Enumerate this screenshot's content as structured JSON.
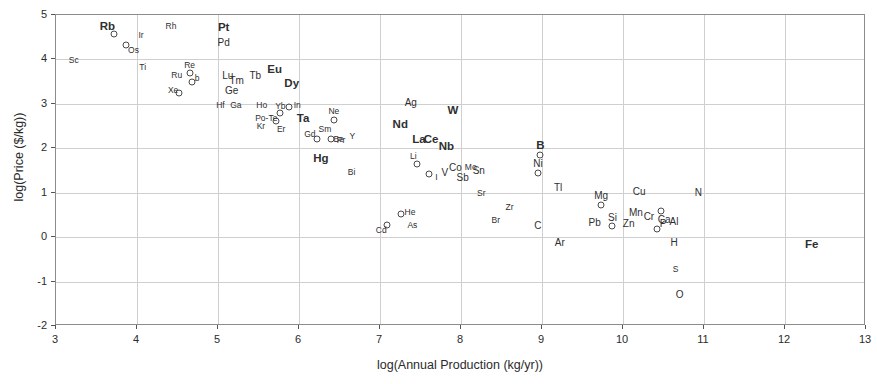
{
  "chart_data": {
    "type": "scatter",
    "title": "",
    "xlabel": "log(Annual Production (kg/yr))",
    "ylabel": "log(Price ($/kg))",
    "xlim": [
      3,
      13
    ],
    "ylim": [
      -2,
      5
    ],
    "xticks": [
      "3",
      "4",
      "5",
      "6",
      "7",
      "8",
      "9",
      "10",
      "11",
      "12",
      "13"
    ],
    "yticks": [
      "5",
      "4",
      "3",
      "2",
      "1",
      "0",
      "-1",
      "-2"
    ],
    "grid": true,
    "legend": "none",
    "marker": "open-circle",
    "point_label_note": "Each point is labelled with its chemical element symbol; some labels are drawn without a visible marker.",
    "points": [
      {
        "label": "Sc",
        "x": 3.22,
        "y": 3.98,
        "size": "sm",
        "marker": false
      },
      {
        "label": "Rb",
        "x": 3.72,
        "y": 4.58,
        "size": "lg",
        "marker": true,
        "dx": -7,
        "dy": -7
      },
      {
        "label": "Os",
        "x": 3.87,
        "y": 4.33,
        "size": "sm",
        "marker": true,
        "dx": 7,
        "dy": 5
      },
      {
        "label": "Ir",
        "x": 4.05,
        "y": 4.56,
        "size": "sm",
        "marker": false
      },
      {
        "label": "Rh",
        "x": 4.42,
        "y": 4.75,
        "size": "sm",
        "marker": false
      },
      {
        "label": "Ti",
        "x": 4.07,
        "y": 3.83,
        "size": "sm",
        "marker": false
      },
      {
        "label": "Ru",
        "x": 4.49,
        "y": 3.66,
        "size": "sm",
        "marker": false
      },
      {
        "label": "Re",
        "x": 4.65,
        "y": 3.7,
        "size": "sm",
        "marker": true,
        "dx": 0,
        "dy": -8
      },
      {
        "label": "b",
        "x": 4.68,
        "y": 3.5,
        "size": "sm",
        "marker": true,
        "dx": 5,
        "dy": -4
      },
      {
        "label": "Xe",
        "x": 4.52,
        "y": 3.25,
        "size": "sm",
        "marker": true,
        "dx": -6,
        "dy": -3
      },
      {
        "label": "Pt",
        "x": 5.07,
        "y": 4.71,
        "size": "lg",
        "marker": false
      },
      {
        "label": "Pd",
        "x": 5.07,
        "y": 4.37,
        "size": "md",
        "marker": false
      },
      {
        "label": "Lu",
        "x": 5.12,
        "y": 3.63,
        "size": "md",
        "marker": false
      },
      {
        "label": "Tm",
        "x": 5.23,
        "y": 3.52,
        "size": "md",
        "marker": false
      },
      {
        "label": "Ge",
        "x": 5.17,
        "y": 3.3,
        "size": "md",
        "marker": false
      },
      {
        "label": "Tb",
        "x": 5.46,
        "y": 3.63,
        "size": "md",
        "marker": false
      },
      {
        "label": "Eu",
        "x": 5.7,
        "y": 3.77,
        "size": "lg",
        "marker": false
      },
      {
        "label": "Hf",
        "x": 5.03,
        "y": 2.97,
        "size": "sm",
        "marker": false
      },
      {
        "label": "Ga",
        "x": 5.22,
        "y": 2.97,
        "size": "sm",
        "marker": false
      },
      {
        "label": "Dy",
        "x": 5.91,
        "y": 3.45,
        "size": "lg",
        "marker": false
      },
      {
        "label": "Ho",
        "x": 5.54,
        "y": 2.98,
        "size": "sm",
        "marker": false
      },
      {
        "label": "In",
        "x": 5.88,
        "y": 2.94,
        "size": "sm",
        "marker": true,
        "dx": 8,
        "dy": -2
      },
      {
        "label": "Yb",
        "x": 5.77,
        "y": 2.8,
        "size": "sm",
        "marker": true,
        "dx": 0,
        "dy": -7
      },
      {
        "label": "Po-Te",
        "x": 5.72,
        "y": 2.62,
        "size": "sm",
        "marker": true,
        "dx": -10,
        "dy": -3
      },
      {
        "label": "Kr",
        "x": 5.53,
        "y": 2.5,
        "size": "sm",
        "marker": false
      },
      {
        "label": "Er",
        "x": 5.78,
        "y": 2.44,
        "size": "sm",
        "marker": false
      },
      {
        "label": "Ta",
        "x": 6.05,
        "y": 2.66,
        "size": "lg",
        "marker": false
      },
      {
        "label": "Ne",
        "x": 6.43,
        "y": 2.64,
        "size": "sm",
        "marker": true,
        "dx": 0,
        "dy": -9
      },
      {
        "label": "Sm",
        "x": 6.32,
        "y": 2.44,
        "size": "sm",
        "marker": false
      },
      {
        "label": "Gd",
        "x": 6.22,
        "y": 2.2,
        "size": "sm",
        "marker": true,
        "dx": -7,
        "dy": -5
      },
      {
        "label": "Be",
        "x": 6.39,
        "y": 2.2,
        "size": "sm",
        "marker": true,
        "dx": 8,
        "dy": 0
      },
      {
        "label": "Pr",
        "x": 6.52,
        "y": 2.19,
        "size": "sm",
        "marker": false
      },
      {
        "label": "Y",
        "x": 6.66,
        "y": 2.28,
        "size": "sm",
        "marker": false
      },
      {
        "label": "Hg",
        "x": 6.27,
        "y": 1.76,
        "size": "lg",
        "marker": false
      },
      {
        "label": "Bi",
        "x": 6.65,
        "y": 1.47,
        "size": "sm",
        "marker": false
      },
      {
        "label": "Ag",
        "x": 7.38,
        "y": 3.02,
        "size": "md",
        "marker": false
      },
      {
        "label": "W",
        "x": 7.9,
        "y": 2.85,
        "size": "lg",
        "marker": false
      },
      {
        "label": "Nd",
        "x": 7.25,
        "y": 2.53,
        "size": "lg",
        "marker": false
      },
      {
        "label": "La",
        "x": 7.48,
        "y": 2.18,
        "size": "lg",
        "marker": false
      },
      {
        "label": "Ce",
        "x": 7.63,
        "y": 2.18,
        "size": "lg",
        "marker": false
      },
      {
        "label": "Nb",
        "x": 7.82,
        "y": 2.02,
        "size": "lg",
        "marker": false
      },
      {
        "label": "Li",
        "x": 7.46,
        "y": 1.65,
        "size": "sm",
        "marker": true,
        "dx": -4,
        "dy": -8
      },
      {
        "label": "I",
        "x": 7.61,
        "y": 1.41,
        "size": "sm",
        "marker": true,
        "dx": 7,
        "dy": 3
      },
      {
        "label": "V",
        "x": 7.8,
        "y": 1.45,
        "size": "md",
        "marker": false
      },
      {
        "label": "Co",
        "x": 7.93,
        "y": 1.55,
        "size": "md",
        "marker": false
      },
      {
        "label": "Cd",
        "x": 7.09,
        "y": 0.28,
        "size": "sm",
        "marker": true,
        "dx": -6,
        "dy": 5
      },
      {
        "label": "He",
        "x": 7.26,
        "y": 0.52,
        "size": "sm",
        "marker": true,
        "dx": 9,
        "dy": -2
      },
      {
        "label": "As",
        "x": 7.4,
        "y": 0.27,
        "size": "sm",
        "marker": false
      },
      {
        "label": "Mo",
        "x": 8.12,
        "y": 1.59,
        "size": "sm",
        "marker": false
      },
      {
        "label": "Sn",
        "x": 8.22,
        "y": 1.48,
        "size": "md",
        "marker": false
      },
      {
        "label": "Sb",
        "x": 8.02,
        "y": 1.33,
        "size": "md",
        "marker": false
      },
      {
        "label": "Sr",
        "x": 8.25,
        "y": 1.0,
        "size": "sm",
        "marker": false
      },
      {
        "label": "Zr",
        "x": 8.6,
        "y": 0.67,
        "size": "sm",
        "marker": false
      },
      {
        "label": "Br",
        "x": 8.43,
        "y": 0.38,
        "size": "sm",
        "marker": false
      },
      {
        "label": "B",
        "x": 8.98,
        "y": 1.86,
        "size": "lg",
        "marker": true,
        "dx": 0,
        "dy": -9
      },
      {
        "label": "Ni",
        "x": 8.95,
        "y": 1.45,
        "size": "md",
        "marker": true,
        "dx": 0,
        "dy": -9
      },
      {
        "label": "Tl",
        "x": 9.2,
        "y": 1.1,
        "size": "md",
        "marker": false
      },
      {
        "label": "C",
        "x": 8.95,
        "y": 0.25,
        "size": "md",
        "marker": false
      },
      {
        "label": "Ar",
        "x": 9.22,
        "y": -0.13,
        "size": "md",
        "marker": false
      },
      {
        "label": "Mg",
        "x": 9.73,
        "y": 0.72,
        "size": "md",
        "marker": true,
        "dx": 0,
        "dy": -9
      },
      {
        "label": "Pb",
        "x": 9.65,
        "y": 0.32,
        "size": "md",
        "marker": false
      },
      {
        "label": "Si",
        "x": 9.87,
        "y": 0.24,
        "size": "md",
        "marker": true,
        "dx": 0,
        "dy": -8
      },
      {
        "label": "Zn",
        "x": 10.07,
        "y": 0.3,
        "size": "md",
        "marker": false
      },
      {
        "label": "Cu",
        "x": 10.2,
        "y": 1.02,
        "size": "md",
        "marker": false
      },
      {
        "label": "Mn",
        "x": 10.16,
        "y": 0.55,
        "size": "md",
        "marker": false
      },
      {
        "label": "Cr",
        "x": 10.32,
        "y": 0.46,
        "size": "md",
        "marker": false
      },
      {
        "label": "Ca",
        "x": 10.47,
        "y": 0.58,
        "size": "md",
        "marker": true,
        "dx": 3,
        "dy": 9
      },
      {
        "label": "P",
        "x": 10.42,
        "y": 0.18,
        "size": "md",
        "marker": true,
        "dx": 6,
        "dy": -5
      },
      {
        "label": "Al",
        "x": 10.63,
        "y": 0.33,
        "size": "md",
        "marker": false
      },
      {
        "label": "N",
        "x": 10.93,
        "y": 1.0,
        "size": "md",
        "marker": false
      },
      {
        "label": "H",
        "x": 10.63,
        "y": -0.13,
        "size": "md",
        "marker": false
      },
      {
        "label": "S",
        "x": 10.65,
        "y": -0.72,
        "size": "sm",
        "marker": false
      },
      {
        "label": "O",
        "x": 10.7,
        "y": -1.3,
        "size": "md",
        "marker": false
      },
      {
        "label": "Fe",
        "x": 12.33,
        "y": -0.18,
        "size": "lg",
        "marker": false
      }
    ]
  }
}
